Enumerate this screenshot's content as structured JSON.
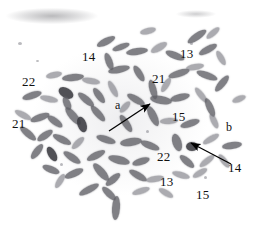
{
  "figure": {
    "kind": "metaphase-chromosome-spread",
    "background_color": "#ffffff",
    "annotation_color": "#111111",
    "width": 254,
    "height": 230
  },
  "labels": [
    {
      "id": "chr14-top",
      "text": "14",
      "x": 82,
      "y": 50
    },
    {
      "id": "chr13-top",
      "text": "13",
      "x": 180,
      "y": 47
    },
    {
      "id": "chr22-left",
      "text": "22",
      "x": 22,
      "y": 75
    },
    {
      "id": "chr21-upper",
      "text": "21",
      "x": 152,
      "y": 72
    },
    {
      "id": "marker-a",
      "text": "a",
      "x": 115,
      "y": 99
    },
    {
      "id": "chr21-left",
      "text": "21",
      "x": 12,
      "y": 117
    },
    {
      "id": "chr15-mid",
      "text": "15",
      "x": 172,
      "y": 110
    },
    {
      "id": "marker-b",
      "text": "b",
      "x": 226,
      "y": 121
    },
    {
      "id": "chr22-lower",
      "text": "22",
      "x": 157,
      "y": 150
    },
    {
      "id": "chr14-right",
      "text": "14",
      "x": 228,
      "y": 161
    },
    {
      "id": "chr13-lower",
      "text": "13",
      "x": 160,
      "y": 175
    },
    {
      "id": "chr15-lower",
      "text": "15",
      "x": 196,
      "y": 188
    }
  ],
  "arrows": [
    {
      "id": "arrow-a",
      "points_to": "a",
      "tail_x": 109,
      "tail_y": 131,
      "head_x": 150,
      "head_y": 104
    },
    {
      "id": "arrow-b",
      "points_to": "14",
      "tail_x": 231,
      "tail_y": 164,
      "head_x": 191,
      "head_y": 143
    }
  ],
  "chromosomes": [
    {
      "x": 140,
      "y": 28,
      "w": 16,
      "h": 6,
      "r": -14,
      "t": "l"
    },
    {
      "x": 186,
      "y": 33,
      "w": 22,
      "h": 7,
      "r": -34,
      "t": "n"
    },
    {
      "x": 205,
      "y": 30,
      "w": 16,
      "h": 6,
      "r": -40,
      "t": "l"
    },
    {
      "x": 96,
      "y": 38,
      "w": 20,
      "h": 7,
      "r": -26,
      "t": "n"
    },
    {
      "x": 112,
      "y": 44,
      "w": 18,
      "h": 6,
      "r": -20,
      "t": "n"
    },
    {
      "x": 126,
      "y": 48,
      "w": 22,
      "h": 7,
      "r": -8,
      "t": "n"
    },
    {
      "x": 150,
      "y": 44,
      "w": 18,
      "h": 7,
      "r": -30,
      "t": "l"
    },
    {
      "x": 165,
      "y": 52,
      "w": 20,
      "h": 7,
      "r": 22,
      "t": "n"
    },
    {
      "x": 198,
      "y": 46,
      "w": 20,
      "h": 7,
      "r": -28,
      "t": "n"
    },
    {
      "x": 213,
      "y": 55,
      "w": 16,
      "h": 6,
      "r": 60,
      "t": "l"
    },
    {
      "x": 100,
      "y": 58,
      "w": 18,
      "h": 7,
      "r": 70,
      "t": "n"
    },
    {
      "x": 108,
      "y": 66,
      "w": 22,
      "h": 7,
      "r": -12,
      "t": "n"
    },
    {
      "x": 46,
      "y": 72,
      "w": 16,
      "h": 6,
      "r": -12,
      "t": "l"
    },
    {
      "x": 62,
      "y": 74,
      "w": 22,
      "h": 7,
      "r": -6,
      "t": "n"
    },
    {
      "x": 82,
      "y": 78,
      "w": 18,
      "h": 6,
      "r": 10,
      "t": "l"
    },
    {
      "x": 130,
      "y": 70,
      "w": 18,
      "h": 7,
      "r": 58,
      "t": "n"
    },
    {
      "x": 143,
      "y": 86,
      "w": 20,
      "h": 7,
      "r": 74,
      "t": "n"
    },
    {
      "x": 168,
      "y": 70,
      "w": 22,
      "h": 7,
      "r": -18,
      "t": "n"
    },
    {
      "x": 186,
      "y": 64,
      "w": 18,
      "h": 6,
      "r": -10,
      "t": "l"
    },
    {
      "x": 196,
      "y": 72,
      "w": 22,
      "h": 7,
      "r": 20,
      "t": "n"
    },
    {
      "x": 212,
      "y": 80,
      "w": 20,
      "h": 7,
      "r": -50,
      "t": "n"
    },
    {
      "x": 22,
      "y": 92,
      "w": 20,
      "h": 7,
      "r": -18,
      "t": "n"
    },
    {
      "x": 40,
      "y": 96,
      "w": 18,
      "h": 6,
      "r": 12,
      "t": "l"
    },
    {
      "x": 58,
      "y": 88,
      "w": 16,
      "h": 10,
      "r": 30,
      "t": "d"
    },
    {
      "x": 60,
      "y": 100,
      "w": 14,
      "h": 7,
      "r": 66,
      "t": "n"
    },
    {
      "x": 76,
      "y": 96,
      "w": 20,
      "h": 7,
      "r": 40,
      "t": "n"
    },
    {
      "x": 90,
      "y": 92,
      "w": 18,
      "h": 7,
      "r": 54,
      "t": "n"
    },
    {
      "x": 104,
      "y": 86,
      "w": 18,
      "h": 6,
      "r": 62,
      "t": "l"
    },
    {
      "x": 126,
      "y": 96,
      "w": 20,
      "h": 7,
      "r": 30,
      "t": "n"
    },
    {
      "x": 150,
      "y": 96,
      "w": 22,
      "h": 8,
      "r": 10,
      "t": "n"
    },
    {
      "x": 170,
      "y": 94,
      "w": 20,
      "h": 7,
      "r": -14,
      "t": "n"
    },
    {
      "x": 192,
      "y": 92,
      "w": 18,
      "h": 6,
      "r": 52,
      "t": "l"
    },
    {
      "x": 200,
      "y": 104,
      "w": 20,
      "h": 7,
      "r": 66,
      "t": "n"
    },
    {
      "x": 14,
      "y": 112,
      "w": 18,
      "h": 6,
      "r": 28,
      "t": "l"
    },
    {
      "x": 30,
      "y": 114,
      "w": 20,
      "h": 7,
      "r": -20,
      "t": "n"
    },
    {
      "x": 46,
      "y": 118,
      "w": 18,
      "h": 7,
      "r": 36,
      "t": "n"
    },
    {
      "x": 62,
      "y": 112,
      "w": 22,
      "h": 8,
      "r": 50,
      "t": "n"
    },
    {
      "x": 74,
      "y": 120,
      "w": 16,
      "h": 9,
      "r": 70,
      "t": "d"
    },
    {
      "x": 88,
      "y": 110,
      "w": 20,
      "h": 7,
      "r": 48,
      "t": "n"
    },
    {
      "x": 116,
      "y": 120,
      "w": 20,
      "h": 7,
      "r": 56,
      "t": "n"
    },
    {
      "x": 142,
      "y": 112,
      "w": 22,
      "h": 8,
      "r": 64,
      "t": "n"
    },
    {
      "x": 160,
      "y": 118,
      "w": 18,
      "h": 6,
      "r": -4,
      "t": "l"
    },
    {
      "x": 180,
      "y": 120,
      "w": 20,
      "h": 7,
      "r": -18,
      "t": "n"
    },
    {
      "x": 206,
      "y": 118,
      "w": 16,
      "h": 6,
      "r": 64,
      "t": "l"
    },
    {
      "x": 18,
      "y": 130,
      "w": 20,
      "h": 7,
      "r": 40,
      "t": "n"
    },
    {
      "x": 36,
      "y": 132,
      "w": 18,
      "h": 7,
      "r": -34,
      "t": "n"
    },
    {
      "x": 52,
      "y": 136,
      "w": 20,
      "h": 7,
      "r": 26,
      "t": "n"
    },
    {
      "x": 70,
      "y": 140,
      "w": 16,
      "h": 6,
      "r": -44,
      "t": "l"
    },
    {
      "x": 96,
      "y": 136,
      "w": 20,
      "h": 7,
      "r": 18,
      "t": "n"
    },
    {
      "x": 120,
      "y": 138,
      "w": 22,
      "h": 8,
      "r": -8,
      "t": "n"
    },
    {
      "x": 140,
      "y": 142,
      "w": 20,
      "h": 7,
      "r": 22,
      "t": "n"
    },
    {
      "x": 168,
      "y": 138,
      "w": 18,
      "h": 9,
      "r": 72,
      "t": "n"
    },
    {
      "x": 186,
      "y": 142,
      "w": 12,
      "h": 9,
      "r": 0,
      "t": "d"
    },
    {
      "x": 202,
      "y": 136,
      "w": 18,
      "h": 6,
      "r": -30,
      "t": "l"
    },
    {
      "x": 222,
      "y": 142,
      "w": 20,
      "h": 7,
      "r": -8,
      "t": "n"
    },
    {
      "x": 28,
      "y": 148,
      "w": 18,
      "h": 7,
      "r": -52,
      "t": "n"
    },
    {
      "x": 44,
      "y": 150,
      "w": 16,
      "h": 8,
      "r": 60,
      "t": "d"
    },
    {
      "x": 62,
      "y": 154,
      "w": 20,
      "h": 7,
      "r": 34,
      "t": "n"
    },
    {
      "x": 86,
      "y": 152,
      "w": 20,
      "h": 7,
      "r": -26,
      "t": "n"
    },
    {
      "x": 108,
      "y": 156,
      "w": 22,
      "h": 8,
      "r": 14,
      "t": "n"
    },
    {
      "x": 132,
      "y": 158,
      "w": 18,
      "h": 7,
      "r": -18,
      "t": "n"
    },
    {
      "x": 178,
      "y": 158,
      "w": 18,
      "h": 7,
      "r": 40,
      "t": "n"
    },
    {
      "x": 198,
      "y": 158,
      "w": 18,
      "h": 6,
      "r": -38,
      "t": "l"
    },
    {
      "x": 216,
      "y": 158,
      "w": 16,
      "h": 6,
      "r": 52,
      "t": "l"
    },
    {
      "x": 42,
      "y": 166,
      "w": 18,
      "h": 7,
      "r": 22,
      "t": "n"
    },
    {
      "x": 64,
      "y": 170,
      "w": 20,
      "h": 7,
      "r": -24,
      "t": "n"
    },
    {
      "x": 90,
      "y": 168,
      "w": 22,
      "h": 8,
      "r": 48,
      "t": "n"
    },
    {
      "x": 104,
      "y": 176,
      "w": 18,
      "h": 7,
      "r": -40,
      "t": "n"
    },
    {
      "x": 128,
      "y": 172,
      "w": 20,
      "h": 7,
      "r": 30,
      "t": "n"
    },
    {
      "x": 146,
      "y": 176,
      "w": 18,
      "h": 6,
      "r": -10,
      "t": "l"
    },
    {
      "x": 172,
      "y": 172,
      "w": 18,
      "h": 6,
      "r": 16,
      "t": "l"
    },
    {
      "x": 192,
      "y": 170,
      "w": 16,
      "h": 6,
      "r": -30,
      "t": "l"
    },
    {
      "x": 78,
      "y": 186,
      "w": 22,
      "h": 7,
      "r": -28,
      "t": "n"
    },
    {
      "x": 100,
      "y": 190,
      "w": 18,
      "h": 7,
      "r": 44,
      "t": "n"
    },
    {
      "x": 112,
      "y": 196,
      "w": 8,
      "h": 24,
      "r": 4,
      "t": "n"
    },
    {
      "x": 132,
      "y": 188,
      "w": 18,
      "h": 6,
      "r": -18,
      "t": "l"
    },
    {
      "x": 158,
      "y": 190,
      "w": 16,
      "h": 6,
      "r": 30,
      "t": "l"
    },
    {
      "x": 52,
      "y": 178,
      "w": 16,
      "h": 6,
      "r": -58,
      "t": "l"
    },
    {
      "x": 118,
      "y": 104,
      "w": 14,
      "h": 6,
      "r": -48,
      "t": "l"
    },
    {
      "x": 158,
      "y": 82,
      "w": 16,
      "h": 6,
      "r": -58,
      "t": "l"
    },
    {
      "x": 232,
      "y": 96,
      "w": 14,
      "h": 6,
      "r": -22,
      "t": "l"
    }
  ],
  "specks": [
    {
      "x": 18,
      "y": 42,
      "w": 4,
      "h": 3
    },
    {
      "x": 190,
      "y": 42,
      "w": 3,
      "h": 3
    },
    {
      "x": 204,
      "y": 50,
      "w": 3,
      "h": 3
    },
    {
      "x": 146,
      "y": 130,
      "w": 3,
      "h": 3
    },
    {
      "x": 60,
      "y": 163,
      "w": 3,
      "h": 3
    },
    {
      "x": 204,
      "y": 176,
      "w": 3,
      "h": 3
    },
    {
      "x": 36,
      "y": 60,
      "w": 3,
      "h": 2
    }
  ]
}
